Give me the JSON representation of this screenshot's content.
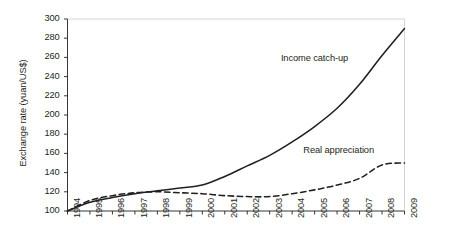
{
  "chart_data": {
    "type": "line",
    "title": "",
    "xlabel": "",
    "ylabel": "Exchange rate (yuan/US$)",
    "xlim": [
      1994,
      2009
    ],
    "ylim": [
      100,
      300
    ],
    "ytick_labels": [
      "100",
      "120",
      "140",
      "160",
      "180",
      "200",
      "220",
      "240",
      "260",
      "280",
      "300"
    ],
    "ytick_values": [
      100,
      120,
      140,
      160,
      180,
      200,
      220,
      240,
      260,
      280,
      300
    ],
    "xtick_labels": [
      "1994",
      "1995",
      "1996",
      "1997",
      "1998",
      "1999",
      "2000",
      "2001",
      "2002",
      "2003",
      "2004",
      "2005",
      "2006",
      "2007",
      "2008",
      "2009"
    ],
    "x": [
      1994,
      1995,
      1996,
      1997,
      1998,
      1999,
      2000,
      2001,
      2002,
      2003,
      2004,
      2005,
      2006,
      2007,
      2008,
      2009
    ],
    "grid": false,
    "legend_position": "inline-annotation",
    "series": [
      {
        "name": "Income catch-up",
        "style": "solid",
        "color": "#231f20",
        "values": [
          100,
          109,
          114,
          118,
          121,
          124,
          127,
          136,
          147,
          158,
          172,
          188,
          207,
          232,
          262,
          290
        ]
      },
      {
        "name": "Real appreciation",
        "style": "dashed",
        "color": "#231f20",
        "values": [
          100,
          111,
          116,
          119,
          120,
          119,
          118,
          116,
          115,
          115,
          118,
          122,
          127,
          134,
          148,
          150
        ]
      }
    ],
    "annotations": [
      {
        "text": "Income catch-up",
        "x": 2005.1,
        "y": 258
      },
      {
        "text": "Real appreciation",
        "x": 2006.1,
        "y": 163
      }
    ]
  }
}
